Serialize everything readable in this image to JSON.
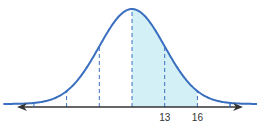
{
  "chart_data": {
    "type": "area",
    "title": "",
    "subtitle": "",
    "xlabel": "",
    "ylabel": "",
    "distribution": "normal",
    "mean": 10,
    "std_dev": 3,
    "xlim": [
      -2,
      22
    ],
    "dashed_lines_at": [
      4,
      7,
      10,
      13,
      16,
      19
    ],
    "tick_marks_at": [
      1,
      19
    ],
    "tick_labels": [
      {
        "x": 13,
        "text": "13"
      },
      {
        "x": 16,
        "text": "16"
      }
    ],
    "shaded_region": {
      "from": 10,
      "to": 16
    },
    "axis_arrows": "both",
    "grid": false,
    "legend": "none",
    "colors": {
      "curve": "#3a6fbf",
      "shade": "#d3f0f7",
      "axis": "#333333",
      "dashed": "#3a6fbf"
    }
  }
}
